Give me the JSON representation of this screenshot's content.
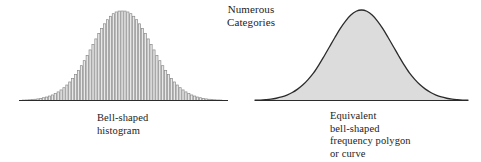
{
  "figure": {
    "name": "bell-shaped-distribution-comparison",
    "background_color": "#ffffff",
    "text_color": "#1c1c1c",
    "heading": {
      "line1": "Numerous",
      "line2": "Categories"
    },
    "left_panel": {
      "caption_line1": "Bell-shaped",
      "caption_line2": "histogram"
    },
    "right_panel": {
      "caption_line1": "Equivalent",
      "caption_line2": "bell-shaped",
      "caption_line3": "frequency polygon",
      "caption_line4": "or curve"
    }
  },
  "chart_data": [
    {
      "id": "bell-shaped-histogram",
      "type": "bar",
      "title": "Bell-shaped histogram",
      "xlabel": "",
      "ylabel": "",
      "grid": false,
      "legend": false,
      "axis_line": "baseline-only",
      "fill_color": "#e8e8e8",
      "outline_color": "#8a8a8a",
      "baseline_color": "#2b2b2b",
      "baseline_x_range_px": [
        19,
        228
      ],
      "peak_x_px": 122,
      "peak_y_px": 11,
      "bar_count": 72,
      "xlim": [
        -3.4,
        3.4
      ],
      "ylim": [
        0,
        1
      ],
      "categories": [
        "-3.40",
        "-3.30",
        "-3.21",
        "-3.11",
        "-3.01",
        "-2.92",
        "-2.82",
        "-2.73",
        "-2.63",
        "-2.53",
        "-2.44",
        "-2.34",
        "-2.25",
        "-2.15",
        "-2.05",
        "-1.96",
        "-1.86",
        "-1.76",
        "-1.67",
        "-1.57",
        "-1.48",
        "-1.38",
        "-1.28",
        "-1.19",
        "-1.09",
        "-0.99",
        "-0.90",
        "-0.80",
        "-0.71",
        "-0.61",
        "-0.51",
        "-0.42",
        "-0.32",
        "-0.23",
        "-0.13",
        "-0.03",
        "0.06",
        "0.16",
        "0.25",
        "0.35",
        "0.45",
        "0.54",
        "0.64",
        "0.73",
        "0.83",
        "0.93",
        "1.02",
        "1.12",
        "1.21",
        "1.31",
        "1.41",
        "1.50",
        "1.60",
        "1.70",
        "1.79",
        "1.89",
        "1.98",
        "2.08",
        "2.18",
        "2.27",
        "2.37",
        "2.46",
        "2.56",
        "2.66",
        "2.75",
        "2.85",
        "2.95",
        "3.04",
        "3.14",
        "3.23",
        "3.33",
        "3.40"
      ],
      "values": [
        0.003,
        0.005,
        0.006,
        0.008,
        0.011,
        0.014,
        0.018,
        0.024,
        0.031,
        0.039,
        0.05,
        0.062,
        0.078,
        0.096,
        0.118,
        0.143,
        0.173,
        0.207,
        0.246,
        0.289,
        0.337,
        0.389,
        0.445,
        0.504,
        0.565,
        0.627,
        0.688,
        0.748,
        0.805,
        0.857,
        0.903,
        0.941,
        0.97,
        0.989,
        0.999,
        1.0,
        0.999,
        0.989,
        0.97,
        0.941,
        0.903,
        0.857,
        0.805,
        0.748,
        0.688,
        0.627,
        0.565,
        0.504,
        0.445,
        0.389,
        0.337,
        0.289,
        0.246,
        0.207,
        0.173,
        0.143,
        0.118,
        0.096,
        0.078,
        0.062,
        0.05,
        0.039,
        0.031,
        0.024,
        0.018,
        0.014,
        0.011,
        0.008,
        0.006,
        0.005,
        0.004,
        0.003
      ]
    },
    {
      "id": "bell-shaped-frequency-polygon",
      "type": "area",
      "title": "Equivalent bell-shaped frequency polygon or curve",
      "xlabel": "",
      "ylabel": "",
      "grid": false,
      "legend": false,
      "axis_line": "baseline-only",
      "fill_color": "#dcdcdc",
      "outline_color": "#2b2b2b",
      "baseline_color": "#2b2b2b",
      "baseline_x_range_px": [
        255,
        468
      ],
      "peak_x_px": 358,
      "peak_y_px": 10,
      "xlim": [
        -3.4,
        3.4
      ],
      "ylim": [
        0,
        1
      ],
      "x": [
        -3.4,
        -3.23,
        -3.06,
        -2.89,
        -2.72,
        -2.55,
        -2.38,
        -2.21,
        -2.04,
        -1.87,
        -1.7,
        -1.53,
        -1.36,
        -1.19,
        -1.02,
        -0.85,
        -0.68,
        -0.51,
        -0.34,
        -0.17,
        0.0,
        0.17,
        0.34,
        0.51,
        0.68,
        0.85,
        1.02,
        1.19,
        1.36,
        1.53,
        1.7,
        1.87,
        2.04,
        2.21,
        2.38,
        2.55,
        2.72,
        2.89,
        3.06,
        3.23,
        3.4
      ],
      "values": [
        0.003,
        0.005,
        0.009,
        0.015,
        0.025,
        0.039,
        0.06,
        0.088,
        0.126,
        0.173,
        0.234,
        0.305,
        0.394,
        0.492,
        0.594,
        0.696,
        0.794,
        0.878,
        0.944,
        0.986,
        1.0,
        0.986,
        0.944,
        0.878,
        0.794,
        0.696,
        0.594,
        0.492,
        0.394,
        0.305,
        0.234,
        0.173,
        0.126,
        0.088,
        0.06,
        0.039,
        0.025,
        0.015,
        0.009,
        0.005,
        0.003
      ]
    }
  ]
}
